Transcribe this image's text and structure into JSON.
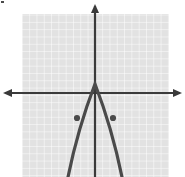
{
  "figure": {
    "name": "parabola-graph",
    "width": 185,
    "height": 177,
    "background_color": "#ffffff"
  },
  "grid": {
    "label": "coordinate-grid",
    "fill_color": "#e2e2e2",
    "line_color": "#ffffff",
    "x_start": 22,
    "y_start": 14,
    "x_end": 169,
    "y_end": 177,
    "cell_size": 7.3,
    "line_width": 1
  },
  "axes": {
    "color": "#3a3a3a",
    "line_width": 2.2,
    "origin_x": 95,
    "origin_y": 93,
    "x_axis": {
      "label": "x-axis",
      "x_from": 5,
      "x_to": 180,
      "arrow_left": true,
      "arrow_right": true
    },
    "y_axis": {
      "label": "y-axis",
      "y_from": 6,
      "y_to": 177,
      "arrow_top": true,
      "arrow_bottom": false
    },
    "arrow_size": 6
  },
  "curve": {
    "label": "parabola-curve",
    "color": "#4a4a4a",
    "line_width": 3.2,
    "direction": "opens-down",
    "vertex_px": [
      95,
      84
    ],
    "path": "M 68,177 Q 78,128 95,84 Q 112,128 122,177",
    "sample_points_px": [
      [
        68,
        177
      ],
      [
        73,
        150
      ],
      [
        77,
        118
      ],
      [
        85,
        97
      ],
      [
        95,
        84
      ],
      [
        105,
        97
      ],
      [
        113,
        118
      ],
      [
        117,
        150
      ],
      [
        122,
        177
      ]
    ]
  },
  "chart_data": {
    "type": "line",
    "title": "",
    "subtitle": "",
    "xlabel": "",
    "ylabel": "",
    "grid": true,
    "legend_position": "none",
    "function": "downward-opening parabola",
    "vertex": [
      0,
      1.2
    ],
    "xlim": [
      -10,
      10.1
    ],
    "ylim": [
      -11.5,
      10.8
    ],
    "unit_px": 7.3,
    "series": [
      {
        "name": "parabola",
        "x": [
          -3.7,
          -3.0,
          -2.45,
          -1.35,
          0,
          1.35,
          2.45,
          3.0,
          3.7
        ],
        "y": [
          -11.5,
          -7.8,
          -3.4,
          -0.55,
          1.2,
          -0.55,
          -3.4,
          -7.8,
          -11.5
        ]
      }
    ],
    "marked_points": [
      {
        "name": "left-point",
        "x": -2.45,
        "y": -3.4,
        "px": [
          77,
          118
        ]
      },
      {
        "name": "right-point",
        "x": 2.45,
        "y": -3.4,
        "px": [
          113,
          118
        ]
      }
    ]
  },
  "points": {
    "label": "marked-points",
    "color": "#4a4a4a",
    "radius": 3.1,
    "items": [
      {
        "name": "point-left",
        "cx": 77,
        "cy": 118
      },
      {
        "name": "point-right",
        "cx": 113,
        "cy": 118
      }
    ]
  },
  "artifact": {
    "label": "corner-speck",
    "color": "#4a4a4a",
    "x": 1,
    "y": 1,
    "width": 3,
    "height": 2
  }
}
